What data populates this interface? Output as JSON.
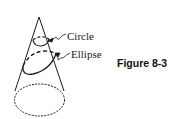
{
  "figure": {
    "caption": "Figure 8-3",
    "labels": {
      "circle": "Circle",
      "ellipse": "Ellipse"
    },
    "shapes": {
      "cone": "cone",
      "circle_section": "circle",
      "ellipse_section": "ellipse",
      "base": "base"
    },
    "colors": {
      "stroke": "#1a1a1a",
      "background": "#ffffff"
    }
  }
}
